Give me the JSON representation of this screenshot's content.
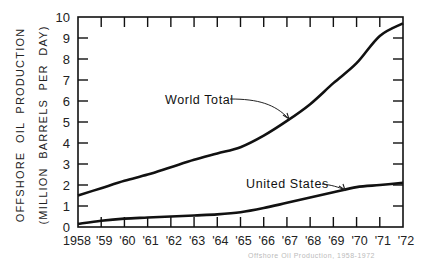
{
  "chart_data": {
    "type": "line",
    "title": "",
    "xlabel": "",
    "ylabel": "OFFSHORE OIL PRODUCTION (MILLION BARRELS PER DAY)",
    "ylabel_lines": [
      "OFFSHORE  OIL  PRODUCTION",
      "(MILLION  BARRELS  PER  DAY)"
    ],
    "x": [
      1958,
      1959,
      1960,
      1961,
      1962,
      1963,
      1964,
      1965,
      1966,
      1967,
      1968,
      1969,
      1970,
      1971,
      1972
    ],
    "x_tick_labels": [
      "1958",
      "'59",
      "'60",
      "'61",
      "'62",
      "'63",
      "'64",
      "'65",
      "'66",
      "'67",
      "'68",
      "'69",
      "'70",
      "'71",
      "'72"
    ],
    "y_ticks": [
      0,
      1,
      2,
      3,
      4,
      5,
      6,
      7,
      8,
      9,
      10
    ],
    "ylim": [
      0,
      10
    ],
    "xlim": [
      1958,
      1972
    ],
    "grid": false,
    "legend": "inline annotations with arrows",
    "series": [
      {
        "name": "World Total",
        "values": [
          1.5,
          1.85,
          2.2,
          2.5,
          2.85,
          3.2,
          3.5,
          3.8,
          4.35,
          5.05,
          5.85,
          6.85,
          7.8,
          9.1,
          9.7
        ]
      },
      {
        "name": "United States",
        "values": [
          0.15,
          0.3,
          0.4,
          0.45,
          0.5,
          0.55,
          0.6,
          0.7,
          0.9,
          1.15,
          1.4,
          1.65,
          1.9,
          2.0,
          2.1
        ]
      }
    ],
    "annotations": [
      {
        "text": "World Total",
        "points_to": "World Total line near 1967"
      },
      {
        "text": "United States",
        "points_to": "United States line near 1969"
      }
    ]
  },
  "caption_fragment": "Offshore Oil Production, 1958-1972"
}
